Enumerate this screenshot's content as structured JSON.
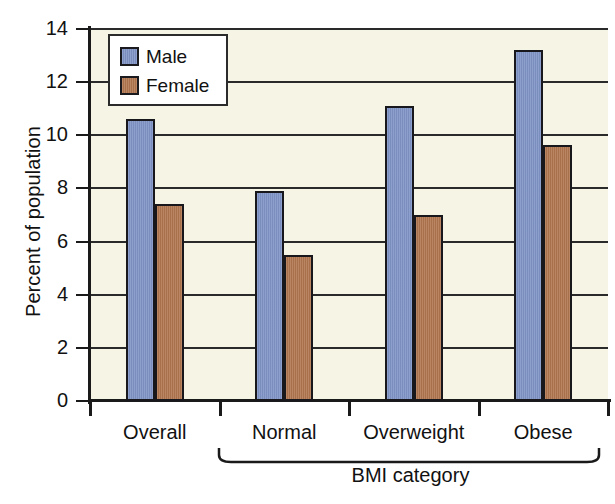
{
  "chart_data": {
    "type": "bar",
    "title": "",
    "subtitle": "",
    "xlabel": "BMI category",
    "ylabel": "Percent of population",
    "categories": [
      "Overall",
      "Normal",
      "Overweight",
      "Obese"
    ],
    "series": [
      {
        "name": "Male",
        "color": "#8094c6",
        "values": [
          10.6,
          7.9,
          11.1,
          13.2
        ]
      },
      {
        "name": "Female",
        "color": "#b1764f",
        "values": [
          7.4,
          5.5,
          7.0,
          9.65
        ]
      }
    ],
    "ylim": [
      0,
      14
    ],
    "ytick_values": [
      0,
      2,
      4,
      6,
      8,
      10,
      12,
      14
    ],
    "ytick_labels": [
      "0",
      "2",
      "4",
      "6",
      "8",
      "10",
      "12",
      "14"
    ],
    "ytick_step": 2,
    "grid": "horizontal",
    "legend_position": "top-left",
    "legend_entries": [
      "Male",
      "Female"
    ],
    "annotations": [
      {
        "type": "brace",
        "label": "BMI category",
        "spans_categories": [
          "Normal",
          "Overweight",
          "Obese"
        ]
      }
    ],
    "plot_background_color": "#f6f4e4",
    "axis_color": "#1a1a1a"
  }
}
